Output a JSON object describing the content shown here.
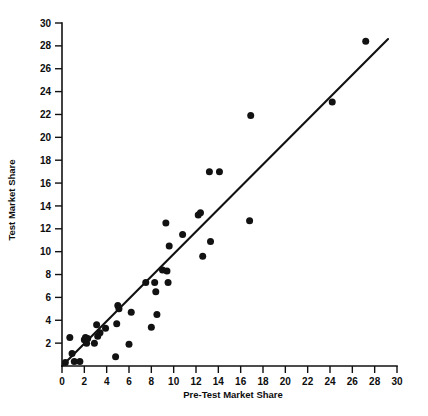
{
  "chart_data": {
    "type": "scatter",
    "title": "",
    "xlabel": "Pre-Test Market Share",
    "ylabel": "Test Market Share",
    "xlim": [
      0,
      30
    ],
    "ylim": [
      0,
      30
    ],
    "grid": false,
    "legend": null,
    "xticks": [
      0,
      2,
      4,
      6,
      8,
      10,
      12,
      14,
      16,
      18,
      20,
      22,
      24,
      26,
      28,
      30
    ],
    "yticks": [
      2,
      4,
      6,
      8,
      10,
      12,
      14,
      16,
      18,
      20,
      22,
      24,
      26,
      28,
      30
    ],
    "xtick_labels": [
      "0",
      "2",
      "4",
      "6",
      "8",
      "10",
      "12",
      "14",
      "16",
      "18",
      "20",
      "22",
      "24",
      "26",
      "28",
      "30"
    ],
    "ytick_labels": [
      "2",
      "4",
      "6",
      "8",
      "10",
      "12",
      "14",
      "16",
      "18",
      "20",
      "22",
      "24",
      "26",
      "28",
      "30"
    ],
    "points": [
      [
        0.3,
        0.3
      ],
      [
        0.7,
        2.5
      ],
      [
        0.9,
        1.1
      ],
      [
        1.1,
        0.4
      ],
      [
        1.6,
        0.4
      ],
      [
        2.0,
        2.3
      ],
      [
        2.1,
        2.5
      ],
      [
        2.2,
        2.0
      ],
      [
        2.3,
        2.4
      ],
      [
        2.9,
        2.0
      ],
      [
        3.1,
        3.6
      ],
      [
        3.2,
        2.6
      ],
      [
        3.4,
        2.9
      ],
      [
        3.9,
        3.3
      ],
      [
        4.8,
        0.8
      ],
      [
        4.9,
        3.7
      ],
      [
        5.0,
        5.3
      ],
      [
        5.1,
        5.0
      ],
      [
        6.0,
        1.9
      ],
      [
        6.2,
        4.7
      ],
      [
        7.5,
        7.3
      ],
      [
        8.0,
        3.4
      ],
      [
        8.3,
        7.3
      ],
      [
        8.4,
        6.5
      ],
      [
        8.5,
        4.5
      ],
      [
        9.0,
        8.4
      ],
      [
        9.3,
        12.5
      ],
      [
        9.4,
        8.3
      ],
      [
        9.5,
        7.3
      ],
      [
        9.6,
        10.5
      ],
      [
        10.8,
        11.5
      ],
      [
        12.2,
        13.2
      ],
      [
        12.4,
        13.4
      ],
      [
        12.6,
        9.6
      ],
      [
        13.2,
        17.0
      ],
      [
        13.3,
        10.9
      ],
      [
        14.1,
        17.0
      ],
      [
        16.8,
        12.7
      ],
      [
        16.9,
        21.9
      ],
      [
        24.2,
        23.1
      ],
      [
        27.2,
        28.4
      ]
    ],
    "fit_line": {
      "type": "line",
      "description": "linear-regression-line",
      "x": [
        0.0,
        29.2
      ],
      "y": [
        0.0,
        28.6
      ]
    }
  }
}
